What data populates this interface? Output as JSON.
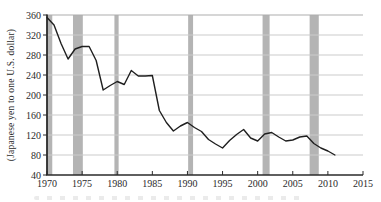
{
  "chart_data": {
    "type": "line",
    "title": "",
    "xlabel": "",
    "ylabel": "(Japanese yen to one U.S. dollar)",
    "xlim": [
      1970,
      2015
    ],
    "ylim": [
      40,
      360
    ],
    "xticks": [
      1970,
      1975,
      1980,
      1985,
      1990,
      1995,
      2000,
      2005,
      2010,
      2015
    ],
    "yticks": [
      40,
      80,
      120,
      160,
      200,
      240,
      280,
      320,
      360
    ],
    "grid": "horizontal",
    "legend": "none",
    "x": [
      1970,
      1971,
      1972,
      1973,
      1974,
      1975,
      1976,
      1977,
      1978,
      1979,
      1980,
      1981,
      1982,
      1983,
      1984,
      1985,
      1986,
      1987,
      1988,
      1989,
      1990,
      1991,
      1992,
      1993,
      1994,
      1995,
      1996,
      1997,
      1998,
      1999,
      2000,
      2001,
      2002,
      2003,
      2004,
      2005,
      2006,
      2007,
      2008,
      2009,
      2010,
      2011
    ],
    "values": [
      355,
      340,
      303,
      272,
      292,
      297,
      297,
      269,
      210,
      219,
      227,
      221,
      249,
      238,
      238,
      239,
      169,
      145,
      128,
      138,
      145,
      135,
      127,
      111,
      102,
      94,
      109,
      121,
      131,
      114,
      108,
      122,
      125,
      116,
      108,
      110,
      116,
      118,
      103,
      94,
      88,
      80
    ],
    "recession_bands": [
      [
        1970.0,
        1970.75
      ],
      [
        1973.7,
        1975.1
      ],
      [
        1979.6,
        1980.2
      ],
      [
        1990.1,
        1990.8
      ],
      [
        2000.7,
        2001.7
      ],
      [
        2007.4,
        2008.7
      ]
    ],
    "colors": {
      "line": "#1f1f1f",
      "band": "#b4b4b4",
      "grid": "#cbcbcb",
      "frame_top": "#adadad",
      "axis": "#2a2a2a",
      "text": "#2b2b2b",
      "background": "#ffffff"
    }
  }
}
